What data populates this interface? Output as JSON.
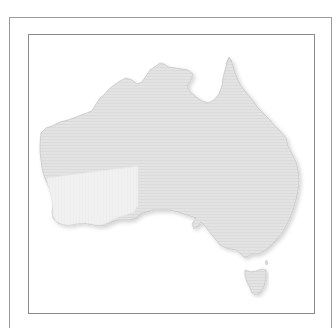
{
  "map": {
    "title": "",
    "region": "Australia",
    "highlighted_region": "South-west Western Australia",
    "colors": {
      "background": "#ffffff",
      "frame": "#8a8a8a",
      "land_fill": "#e2e2e2",
      "land_texture": "#d8d8d8",
      "land_outline": "#c4c4c4",
      "highlight_fill": "#f0f0f0",
      "shadow": "#d0d0d0"
    },
    "labels": []
  }
}
